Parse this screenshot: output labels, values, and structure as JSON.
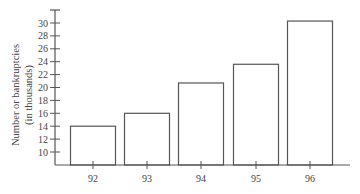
{
  "chart_data": {
    "type": "bar",
    "title": "",
    "xlabel": "",
    "ylabel": "Number or bankruptcies",
    "ylabel_line2": "(in thousands)",
    "categories": [
      "92",
      "93",
      "94",
      "95",
      "96"
    ],
    "values": [
      14.0,
      16.0,
      20.7,
      23.6,
      30.3
    ],
    "yticks": [
      10,
      12,
      14,
      16,
      18,
      20,
      22,
      24,
      26,
      28,
      30
    ],
    "ylim": [
      8,
      31
    ],
    "grid": false,
    "legend": null,
    "bar_fill": "#ffffff",
    "bar_stroke": "#555555",
    "axis_color": "#555555"
  }
}
